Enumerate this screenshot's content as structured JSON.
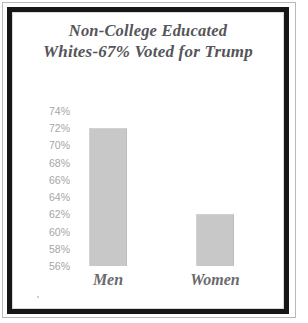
{
  "figure": {
    "frame_color": "#161616",
    "background": "#ffffff"
  },
  "chart_data": {
    "type": "bar",
    "title": "Non-College Educated Whites-67% Voted for Trump",
    "title_lines": [
      "Non-College Educated",
      "Whites-67% Voted for Trump"
    ],
    "categories": [
      "Men",
      "Women"
    ],
    "values": [
      72,
      62
    ],
    "value_labels": [
      "72%",
      "62%"
    ],
    "xlabel": "",
    "ylabel": "",
    "ylim": [
      56,
      74
    ],
    "ytick_step": 2,
    "ytick_labels": [
      "74%",
      "72%",
      "70%",
      "68%",
      "66%",
      "64%",
      "62%",
      "60%",
      "58%",
      "56%"
    ],
    "ytick_values": [
      74,
      72,
      70,
      68,
      66,
      64,
      62,
      60,
      58,
      56
    ],
    "grid": false,
    "legend": false,
    "bar_color": "#c8c8c8",
    "tick_label_color": "#a6a6a6",
    "category_label_color": "#6a6a6e",
    "title_color": "#55555a"
  }
}
